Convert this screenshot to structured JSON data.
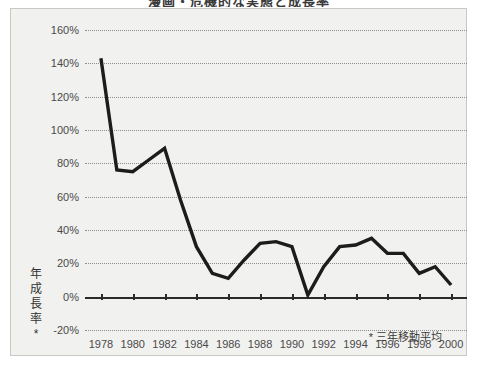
{
  "chart_data": {
    "type": "line",
    "title": "漫画・危機的な実態と成長率",
    "xlabel": "",
    "ylabel": "年成長率*",
    "ylabel_chars": [
      "年",
      "成",
      "長",
      "率",
      "*"
    ],
    "footnote": "* 三年移動平均",
    "grid": true,
    "legend": null,
    "xlim": [
      1977,
      2001
    ],
    "ylim": [
      -20,
      160
    ],
    "ytick_labels": [
      "160%",
      "140%",
      "120%",
      "100%",
      "80%",
      "60%",
      "40%",
      "20%",
      "0%",
      "-20%"
    ],
    "ytick_values": [
      160,
      140,
      120,
      100,
      80,
      60,
      40,
      20,
      0,
      -20
    ],
    "xtick_labels": [
      "1978",
      "1980",
      "1982",
      "1984",
      "1986",
      "1988",
      "1990",
      "1992",
      "1994",
      "1996",
      "1998",
      "2000"
    ],
    "xtick_values": [
      1978,
      1980,
      1982,
      1984,
      1986,
      1988,
      1990,
      1992,
      1994,
      1996,
      1998,
      2000
    ],
    "x": [
      1978,
      1979,
      1980,
      1981,
      1982,
      1983,
      1984,
      1985,
      1986,
      1987,
      1988,
      1989,
      1990,
      1991,
      1992,
      1993,
      1994,
      1995,
      1996,
      1997,
      1998,
      1999,
      2000
    ],
    "values": [
      143,
      76,
      75,
      82,
      89,
      58,
      30,
      14,
      11,
      22,
      32,
      33,
      30,
      1,
      18,
      30,
      31,
      35,
      26,
      26,
      14,
      18,
      7
    ],
    "series_color": "#1c1c1c",
    "grid_color": "#8d8d8d",
    "background_color": "#f1f1ef"
  }
}
